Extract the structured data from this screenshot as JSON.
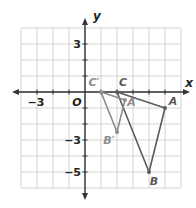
{
  "diagram": {
    "type": "coordinate-plane-dilation",
    "axes": {
      "x_label": "x",
      "y_label": "y",
      "origin_label": "O",
      "x_range": [
        -4,
        6
      ],
      "y_range": [
        -6,
        4
      ],
      "x_tick_labels": [
        {
          "value": -3,
          "text": "−3"
        }
      ],
      "y_tick_labels": [
        {
          "value": 3,
          "text": "3"
        },
        {
          "value": -3,
          "text": "−3"
        },
        {
          "value": -5,
          "text": "−5"
        }
      ]
    },
    "triangles": [
      {
        "name": "original",
        "color": "#5a5a5a",
        "vertices": [
          {
            "label": "C",
            "x": 2,
            "y": 0
          },
          {
            "label": "A",
            "x": 5,
            "y": -1
          },
          {
            "label": "B",
            "x": 4,
            "y": -5
          }
        ]
      },
      {
        "name": "image",
        "color": "#8c8c8c",
        "vertices": [
          {
            "label": "C′",
            "x": 1,
            "y": 0
          },
          {
            "label": "A′",
            "x": 2.5,
            "y": -0.5
          },
          {
            "label": "B′",
            "x": 2,
            "y": -2.5
          }
        ]
      }
    ],
    "colors": {
      "grid": "#c8c8c8",
      "axis": "#333333",
      "original": "#5a5a5a",
      "image": "#8c8c8c"
    }
  }
}
